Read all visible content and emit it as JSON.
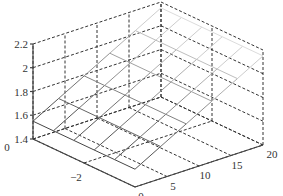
{
  "chart_data": {
    "type": "surface",
    "title": "",
    "xlabel": "",
    "ylabel": "",
    "zlabel": "",
    "x_ticks": [
      "0",
      "5",
      "10",
      "15",
      "20"
    ],
    "y_ticks": [
      "0",
      "-2",
      "-4"
    ],
    "z_ticks": [
      "1.4",
      "1.6",
      "1.8",
      "2",
      "2.2"
    ],
    "x_range": [
      0,
      20
    ],
    "y_range": [
      -4,
      0
    ],
    "z_range": [
      1.4,
      2.2
    ],
    "grid": true,
    "grid_style": "dashed",
    "x": [
      0,
      4,
      8,
      12,
      16,
      20
    ],
    "y": [
      0,
      -0.8,
      -1.6,
      -2.4,
      -3.2,
      -4
    ],
    "z_rows_by_y": [
      [
        1.55,
        1.67,
        1.79,
        1.91,
        2.03,
        2.15
      ],
      [
        1.55,
        1.67,
        1.79,
        1.91,
        2.03,
        2.15
      ],
      [
        1.55,
        1.67,
        1.79,
        1.91,
        2.03,
        2.15
      ],
      [
        1.55,
        1.67,
        1.79,
        1.91,
        2.03,
        2.15
      ],
      [
        1.55,
        1.67,
        1.79,
        1.91,
        2.03,
        2.15
      ],
      [
        1.55,
        1.67,
        1.79,
        1.91,
        2.03,
        2.15
      ]
    ],
    "colors": {
      "axis": "#444444",
      "grid": "#333333",
      "surface_front": "#555555",
      "surface_back": "#cccccc"
    }
  }
}
